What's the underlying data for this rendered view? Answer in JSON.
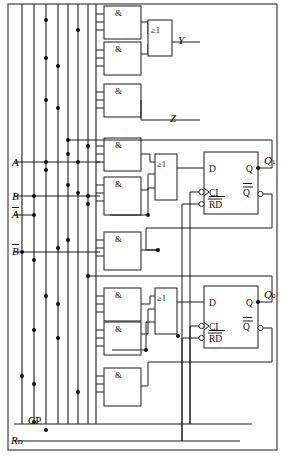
{
  "diagram": {
    "type": "logic-schematic",
    "background_color": "#ffffff",
    "line_color": "#1a1a1a"
  },
  "inputs": [
    {
      "name": "input-A",
      "label": "A",
      "bar": false,
      "subscript": "",
      "y": 162
    },
    {
      "name": "input-B",
      "label": "B",
      "bar": false,
      "subscript": "",
      "y": 196
    },
    {
      "name": "input-A-bar",
      "label": "A",
      "bar": true,
      "subscript": "",
      "y": 215
    },
    {
      "name": "input-B-bar",
      "label": "B",
      "bar": true,
      "subscript": "",
      "y": 252
    },
    {
      "name": "input-CP",
      "label": "CP",
      "bar": false,
      "subscript": "",
      "y": 424
    },
    {
      "name": "input-RD",
      "label": "R",
      "bar": false,
      "subscript": "D",
      "y": 441
    }
  ],
  "outputs": [
    {
      "name": "output-Y",
      "label": "Y",
      "subscript": "",
      "x": 178,
      "y": 42
    },
    {
      "name": "output-Z",
      "label": "Z",
      "subscript": "",
      "x": 170,
      "y": 120
    },
    {
      "name": "output-Q1",
      "label": "Q",
      "subscript": "1",
      "x": 268,
      "y": 161
    },
    {
      "name": "output-Q0",
      "label": "Q",
      "subscript": "0",
      "x": 268,
      "y": 294
    }
  ],
  "and_gates": [
    {
      "name": "and-gate-1",
      "symbol": "&",
      "x": 104,
      "y": 6,
      "w": 37,
      "h": 33,
      "inputs": 3
    },
    {
      "name": "and-gate-2",
      "symbol": "&",
      "x": 104,
      "y": 42,
      "w": 37,
      "h": 33,
      "inputs": 3
    },
    {
      "name": "and-gate-3",
      "symbol": "&",
      "x": 104,
      "y": 84,
      "w": 37,
      "h": 33,
      "inputs": 3
    },
    {
      "name": "and-gate-4",
      "symbol": "&",
      "x": 104,
      "y": 138,
      "w": 37,
      "h": 33,
      "inputs": 3
    },
    {
      "name": "and-gate-5",
      "symbol": "&",
      "x": 104,
      "y": 177,
      "w": 37,
      "h": 38,
      "inputs": 3
    },
    {
      "name": "and-gate-6",
      "symbol": "&",
      "x": 104,
      "y": 232,
      "w": 37,
      "h": 38,
      "inputs": 3
    },
    {
      "name": "and-gate-7",
      "symbol": "&",
      "x": 104,
      "y": 288,
      "w": 37,
      "h": 33,
      "inputs": 3
    },
    {
      "name": "and-gate-8",
      "symbol": "&",
      "x": 104,
      "y": 322,
      "w": 37,
      "h": 33,
      "inputs": 3
    },
    {
      "name": "and-gate-9",
      "symbol": "&",
      "x": 104,
      "y": 368,
      "w": 37,
      "h": 38,
      "inputs": 3
    }
  ],
  "or_gates": [
    {
      "name": "or-gate-Y",
      "symbol": "≥1",
      "x": 148,
      "y": 20,
      "w": 24,
      "h": 36,
      "inputs": 2
    },
    {
      "name": "or-gate-D1",
      "symbol": "≥1",
      "x": 155,
      "y": 154,
      "w": 22,
      "h": 46,
      "inputs": 3
    },
    {
      "name": "or-gate-D0",
      "symbol": "≥1",
      "x": 155,
      "y": 288,
      "w": 22,
      "h": 46,
      "inputs": 3
    }
  ],
  "flip_flops": [
    {
      "name": "flip-flop-1",
      "x": 204,
      "y": 152,
      "w": 54,
      "h": 62,
      "pins": {
        "d": "D",
        "q": "Q",
        "clk": "CI",
        "reset": "RD",
        "qbar": "Q"
      },
      "clk_inverted": true,
      "reset_inverted": true,
      "reset_overbar": true,
      "qbar_overbar": true
    },
    {
      "name": "flip-flop-0",
      "x": 204,
      "y": 286,
      "w": 54,
      "h": 62,
      "pins": {
        "d": "D",
        "q": "Q",
        "clk": "CI",
        "reset": "RD",
        "qbar": "Q"
      },
      "clk_inverted": true,
      "reset_inverted": true,
      "reset_overbar": true,
      "qbar_overbar": true
    }
  ],
  "bus_lines": [
    {
      "name": "bus-line-1",
      "x": 22
    },
    {
      "name": "bus-line-2",
      "x": 34
    },
    {
      "name": "bus-line-3",
      "x": 46
    },
    {
      "name": "bus-line-4",
      "x": 58
    },
    {
      "name": "bus-line-5",
      "x": 68
    },
    {
      "name": "bus-line-6",
      "x": 78
    },
    {
      "name": "bus-line-7",
      "x": 88
    },
    {
      "name": "bus-line-8",
      "x": 96
    }
  ],
  "border": {
    "name": "diagram-border",
    "x": 8,
    "y": 4,
    "w": 269,
    "h": 446
  }
}
